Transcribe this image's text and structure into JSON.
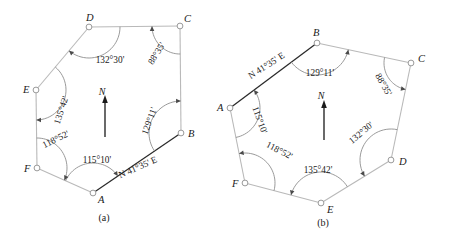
{
  "figure": {
    "kind": "surveying-traverse-diagram",
    "background_color": "#ffffff",
    "edge_color": "#b9b9b9",
    "bearing_edge_color": "#2b2b2b",
    "arc_color": "#8f8f8f",
    "text_color": "#1a1a1a"
  },
  "panels": [
    {
      "id": "a",
      "caption": "(a)",
      "caption_pos": [
        104,
        221
      ],
      "direction": "counterclockwise",
      "north": {
        "label": "N",
        "label_pos": [
          102,
          95
        ],
        "x": 105,
        "y_top": 100,
        "y_bottom": 137
      },
      "bearing": {
        "text": "N 41°35' E",
        "edge": "A-B",
        "pos": [
          139,
          170
        ],
        "rotation": -24
      },
      "vertices": [
        {
          "name": "A",
          "x": 93,
          "y": 193,
          "label_dx": 5,
          "label_dy": 10
        },
        {
          "name": "B",
          "x": 181,
          "y": 133,
          "label_dx": 7,
          "label_dy": 4
        },
        {
          "name": "C",
          "x": 180,
          "y": 26,
          "label_dx": 4,
          "label_dy": -4
        },
        {
          "name": "D",
          "x": 89,
          "y": 27,
          "label_dx": -3,
          "label_dy": -6
        },
        {
          "name": "E",
          "x": 36,
          "y": 90,
          "label_dx": -13,
          "label_dy": 3
        },
        {
          "name": "F",
          "x": 37,
          "y": 168,
          "label_dx": -13,
          "label_dy": 4
        }
      ],
      "angles": [
        {
          "at": "A",
          "text": "115°10'",
          "pos": [
            97,
            163
          ],
          "rotation": 0,
          "radius": 30,
          "anchor": "middle"
        },
        {
          "at": "B",
          "text": "129°11'",
          "pos": [
            152,
            122
          ],
          "rotation": -70,
          "radius": 32,
          "anchor": "middle"
        },
        {
          "at": "C",
          "text": "88°35'",
          "pos": [
            159,
            55
          ],
          "rotation": -58,
          "radius": 28,
          "anchor": "middle"
        },
        {
          "at": "D",
          "text": "132°30'",
          "pos": [
            110,
            63
          ],
          "rotation": 0,
          "radius": 31,
          "anchor": "middle"
        },
        {
          "at": "E",
          "text": "135°42'",
          "pos": [
            64,
            111
          ],
          "rotation": -72,
          "radius": 30,
          "anchor": "middle"
        },
        {
          "at": "F",
          "text": "118°52'",
          "pos": [
            57,
            142
          ],
          "rotation": -26,
          "radius": 30,
          "anchor": "middle"
        }
      ]
    },
    {
      "id": "b",
      "caption": "(b)",
      "caption_pos": [
        323,
        226
      ],
      "direction": "clockwise",
      "north": {
        "label": "N",
        "label_pos": [
          321,
          99
        ],
        "x": 324,
        "y_top": 105,
        "y_bottom": 140
      },
      "bearing": {
        "text": "N 41°35' E",
        "edge": "A-B",
        "pos": [
          268,
          68
        ],
        "rotation": -33
      },
      "vertices": [
        {
          "name": "A",
          "x": 230,
          "y": 108,
          "label_dx": -13,
          "label_dy": 3
        },
        {
          "name": "B",
          "x": 317,
          "y": 43,
          "label_dx": -4,
          "label_dy": -7
        },
        {
          "name": "C",
          "x": 411,
          "y": 63,
          "label_dx": 7,
          "label_dy": -1
        },
        {
          "name": "D",
          "x": 391,
          "y": 160,
          "label_dx": 8,
          "label_dy": 5
        },
        {
          "name": "E",
          "x": 321,
          "y": 203,
          "label_dx": 6,
          "label_dy": 10
        },
        {
          "name": "F",
          "x": 245,
          "y": 183,
          "label_dx": -13,
          "label_dy": 4
        }
      ],
      "angles": [
        {
          "at": "A",
          "text": "115°10'",
          "pos": [
            257,
            121
          ],
          "rotation": 70,
          "radius": 30,
          "anchor": "middle"
        },
        {
          "at": "B",
          "text": "129°11'",
          "pos": [
            320,
            76
          ],
          "rotation": 0,
          "radius": 32,
          "anchor": "middle"
        },
        {
          "at": "C",
          "text": "88°35'",
          "pos": [
            381,
            86
          ],
          "rotation": 60,
          "radius": 27,
          "anchor": "middle"
        },
        {
          "at": "D",
          "text": "132°30'",
          "pos": [
            363,
            135
          ],
          "rotation": -40,
          "radius": 31,
          "anchor": "middle"
        },
        {
          "at": "E",
          "text": "135°42'",
          "pos": [
            318,
            173
          ],
          "rotation": 0,
          "radius": 31,
          "anchor": "middle"
        },
        {
          "at": "F",
          "text": "118°52'",
          "pos": [
            278,
            153
          ],
          "rotation": 27,
          "radius": 30,
          "anchor": "middle"
        }
      ]
    }
  ]
}
